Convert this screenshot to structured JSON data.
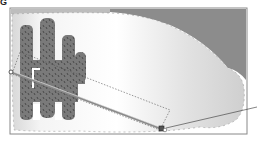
{
  "figure": {
    "label": "G",
    "colors": {
      "frame_border": "#888888",
      "sky_dark": "#8c8c8c",
      "gradient_light": "#ffffff",
      "gradient_dark": "#d2d2d2",
      "cactus": "#7a7a7a",
      "cactus_spines": "#3a3a3a",
      "gradient_bar": "#8a8a8a",
      "leader_line": "#333333"
    },
    "tools": {
      "gradient_start_handle": "gradient-start",
      "gradient_end_handle": "gradient-end",
      "bounding_box": "gradient-bounds"
    }
  }
}
